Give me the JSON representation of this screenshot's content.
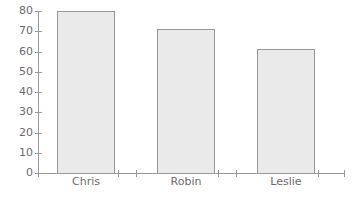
{
  "chart_data": {
    "type": "bar",
    "title": "",
    "subtitle": "",
    "xlabel": "",
    "ylabel": "",
    "categories": [
      "Chris",
      "Robin",
      "Leslie"
    ],
    "values": [
      80,
      71,
      61
    ],
    "ylim": [
      0,
      80
    ],
    "ytick_labels": [
      "80",
      "70",
      "60",
      "50",
      "40",
      "30",
      "20",
      "10",
      "0"
    ],
    "ytick_values": [
      80,
      70,
      60,
      50,
      40,
      30,
      20,
      10,
      0
    ],
    "ytick_step": 10,
    "grid": false,
    "legend": false,
    "legend_position": "none",
    "annotations": [],
    "series": [
      {
        "name": "",
        "values": [
          80,
          71,
          61
        ]
      }
    ]
  },
  "style": {
    "background": "#ffffff",
    "bar_fill": "#eaeaea",
    "bar_stroke": "#969696",
    "axis_color": "#9a9a9a",
    "tick_color": "#9a9a9a",
    "label_color": "#6b6b6b"
  },
  "geometry": {
    "width": 353,
    "height": 197,
    "plot_left": 38,
    "plot_right": 345,
    "plot_top": 11,
    "plot_bottom": 173,
    "bar_width": 57,
    "bar_centers": [
      86,
      186,
      286
    ],
    "bar_lefts": [
      57,
      157,
      257
    ],
    "xtick_positions": [
      38,
      118,
      136,
      218,
      236,
      318,
      344
    ],
    "xlabel_y": 177,
    "ytick_label_x": 33
  }
}
